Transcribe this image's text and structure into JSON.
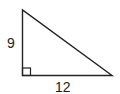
{
  "diagram": {
    "type": "right-triangle",
    "legs": {
      "vertical": "9",
      "horizontal": "12"
    },
    "right_angle_marker": true,
    "stroke_color": "#222222"
  }
}
